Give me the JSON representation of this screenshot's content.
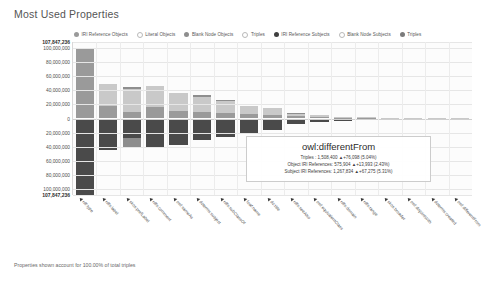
{
  "chart": {
    "title": "Most Used Properties",
    "footer": "Properties shown account for 100.00% of total triples"
  },
  "legend": {
    "items": [
      {
        "label": "IRI Reference Objects",
        "color": "#9a9a9a",
        "filled": true
      },
      {
        "label": "Literal Objects",
        "color": "#c9c9c9",
        "filled": false
      },
      {
        "label": "Blank Node Objects",
        "color": "#8e8e8e",
        "filled": true
      },
      {
        "label": "Triples",
        "color": "#d2d2d2",
        "filled": false
      },
      {
        "label": "IRI Reference Subjects",
        "color": "#3f3f3f",
        "filled": true
      },
      {
        "label": "Blank Node Subjects",
        "color": "#adadad",
        "filled": false
      },
      {
        "label": "Triples",
        "color": "#7b7b7b",
        "filled": true
      }
    ]
  },
  "tooltip": {
    "title": "owl:differentFrom",
    "rows": [
      "Triples : 1,508,400  ▲+76,098 (5.04%)",
      "Object IRI References: 575,904  ▲+13,993 (2.43%)",
      "Subject IRI References: 1,267,834  ▲+67,275 (5.31%)"
    ]
  },
  "chart_data": {
    "type": "bar",
    "title": "Most Used Properties",
    "xlabel": "",
    "ylabel": "",
    "grid": true,
    "legend_position": "top",
    "orientation": "diverging-vertical",
    "ylim": [
      -107847236,
      107847236
    ],
    "yticks": [
      {
        "value": 107847236,
        "label": "107,847,236",
        "bold": true
      },
      {
        "value": 100000000,
        "label": "100,000,000",
        "bold": false
      },
      {
        "value": 80000000,
        "label": "80,000,000",
        "bold": false
      },
      {
        "value": 60000000,
        "label": "60,000,000",
        "bold": false
      },
      {
        "value": 40000000,
        "label": "40,000,000",
        "bold": false
      },
      {
        "value": 20000000,
        "label": "20,000,000",
        "bold": false
      },
      {
        "value": 0,
        "label": "0",
        "bold": false
      },
      {
        "value": -20000000,
        "label": "20,000,000",
        "bold": false
      },
      {
        "value": -40000000,
        "label": "40,000,000",
        "bold": false
      },
      {
        "value": -60000000,
        "label": "60,000,000",
        "bold": false
      },
      {
        "value": -80000000,
        "label": "80,000,000",
        "bold": false
      },
      {
        "value": -100000000,
        "label": "100,000,000",
        "bold": false
      },
      {
        "value": -107847236,
        "label": "107,847,236",
        "bold": true
      }
    ],
    "categories": [
      "rdf:type",
      "rdfs:label",
      "skos:prefLabel",
      "rdfs:comment",
      "owl:sameAs",
      "dcterms:subject",
      "rdfs:subClassOf",
      "foaf:name",
      "dc:title",
      "rdfs:seeAlso",
      "owl:equivalentClass",
      "rdfs:domain",
      "rdfs:range",
      "skos:broader",
      "owl:disjointWith",
      "dcterms:created",
      "owl:differentFrom"
    ],
    "series": [
      {
        "name": "IRI Reference Objects",
        "color": "#9a9a9a",
        "values": [
          98000000,
          18000000,
          9000000,
          16000000,
          10000000,
          9000000,
          7500000,
          6000000,
          5500000,
          3000000,
          2000000,
          1200000,
          800000,
          500000,
          350000,
          200000,
          575904
        ]
      },
      {
        "name": "Literal Objects",
        "color": "#c9c9c9",
        "values": [
          0,
          30000000,
          33000000,
          30000000,
          26000000,
          22000000,
          18000000,
          12000000,
          9000000,
          4000000,
          2500000,
          1500000,
          900000,
          600000,
          400000,
          250000,
          300000
        ]
      },
      {
        "name": "Blank Node Objects",
        "color": "#8e8e8e",
        "values": [
          0,
          0,
          2000000,
          0,
          0,
          1500000,
          1000000,
          0,
          0,
          500000,
          0,
          0,
          0,
          0,
          0,
          0,
          0
        ]
      },
      {
        "name": "IRI Reference Subjects",
        "color": "#4a4a4a",
        "values": [
          107847236,
          44000000,
          28000000,
          40000000,
          38000000,
          30000000,
          26000000,
          20000000,
          16000000,
          8000000,
          5000000,
          3000000,
          1800000,
          1000000,
          700000,
          400000,
          1267834
        ]
      },
      {
        "name": "Blank Node Subjects",
        "color": "#8d8d8d",
        "values": [
          0,
          0,
          14000000,
          0,
          0,
          0,
          0,
          0,
          0,
          0,
          0,
          0,
          0,
          0,
          0,
          0,
          0
        ]
      }
    ]
  }
}
